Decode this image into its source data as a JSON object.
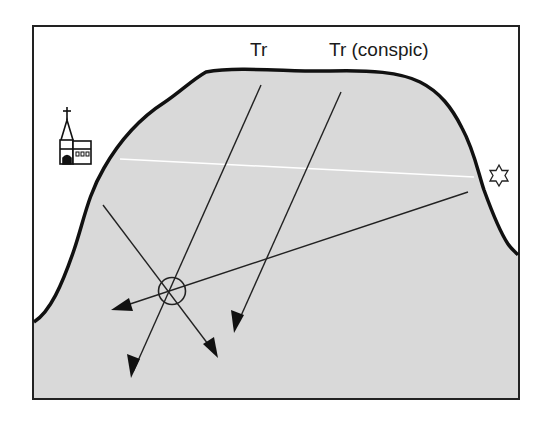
{
  "diagram": {
    "type": "nautical-transit-bearings",
    "labels": {
      "tr": "Tr",
      "tr_conspic": "Tr (conspic)"
    },
    "landmarks": [
      {
        "name": "church",
        "icon": "church-icon"
      },
      {
        "name": "star-mark",
        "icon": "star-icon"
      }
    ],
    "position_fix": {
      "icon": "position-circle-icon"
    },
    "colors": {
      "land_fill": "#d9d9d9",
      "outline": "#111111",
      "background": "#ffffff",
      "transit_line": "#ffffff",
      "bearing_line": "#222222"
    }
  }
}
